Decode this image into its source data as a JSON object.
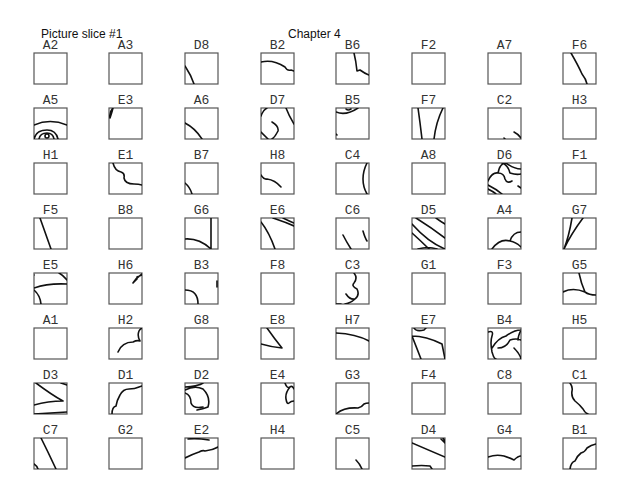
{
  "header": {
    "left_title": "Picture slice #1",
    "center_title": "Chapter 4"
  },
  "grid": {
    "rows": 8,
    "cols": 8,
    "cells": [
      {
        "label": "A2",
        "row": 0,
        "col": 0,
        "path": ""
      },
      {
        "label": "A3",
        "row": 0,
        "col": 1,
        "path": ""
      },
      {
        "label": "D8",
        "row": 0,
        "col": 2,
        "path": "M0 13 Q6 22 9 31"
      },
      {
        "label": "B2",
        "row": 0,
        "col": 3,
        "path": "M0 9 Q12 6 24 14 Q26 18 30 17 L33 18"
      },
      {
        "label": "B6",
        "row": 0,
        "col": 4,
        "path": "M18 0 Q20 8 21 18 L24 17 Q28 20 33 22"
      },
      {
        "label": "F2",
        "row": 0,
        "col": 5,
        "path": ""
      },
      {
        "label": "A7",
        "row": 0,
        "col": 6,
        "path": ""
      },
      {
        "label": "F6",
        "row": 0,
        "col": 7,
        "path": "M8 0 Q15 12 19 21 Q23 26 24 31"
      },
      {
        "label": "A5",
        "row": 1,
        "col": 0,
        "path": "M0 17 Q16 10 33 17 M0 31 Q2 22 13 22 Q22 22 24 31 M5 31 Q6 25 13 25 Q19 25 20 31 M11 28 a2 2 0 1 0 4 0 a2 2 0 1 0 -4 0"
      },
      {
        "label": "E3",
        "row": 1,
        "col": 1,
        "path": "M4 0 Q0 4 1 10 M4 0 Q3 4 1 10"
      },
      {
        "label": "A6",
        "row": 1,
        "col": 2,
        "path": "M0 15 Q10 20 17 31"
      },
      {
        "label": "D7",
        "row": 1,
        "col": 3,
        "path": "M0 8 Q2 2 6 0 M25 0 Q28 8 33 16 M11 14 Q18 18 17 23 Q14 29 11 31 M0 24 Q4 28 7 31"
      },
      {
        "label": "B5",
        "row": 1,
        "col": 4,
        "path": "M0 4 Q10 8 22 0 M15 1 Q12 3 10 1 M0 26 L1 27"
      },
      {
        "label": "F7",
        "row": 1,
        "col": 5,
        "path": "M6 0 Q8 14 10 31 M31 0 Q24 14 22 31"
      },
      {
        "label": "C2",
        "row": 1,
        "col": 6,
        "path": "M26 24 Q30 26 33 30 M16 30 L17 31"
      },
      {
        "label": "H3",
        "row": 1,
        "col": 7,
        "path": ""
      },
      {
        "label": "H1",
        "row": 2,
        "col": 0,
        "path": ""
      },
      {
        "label": "E1",
        "row": 2,
        "col": 1,
        "path": "M4 0 Q6 8 12 9 Q16 10 15 15 Q16 21 25 21 Q30 21 33 22"
      },
      {
        "label": "B7",
        "row": 2,
        "col": 2,
        "path": "M0 20 Q5 24 7 31"
      },
      {
        "label": "H8",
        "row": 2,
        "col": 3,
        "path": "M0 12 Q3 17 6 16 Q14 17 20 24"
      },
      {
        "label": "C4",
        "row": 2,
        "col": 4,
        "path": "M31 0 Q27 8 27 16 Q27 24 31 31"
      },
      {
        "label": "A8",
        "row": 2,
        "col": 5,
        "path": ""
      },
      {
        "label": "D6",
        "row": 2,
        "col": 6,
        "path": "M0 18 Q4 9 10 10 Q16 10 17 16 Q19 21 24 18 M10 10 Q12 0 18 0 M18 0 Q26 6 33 6 M14 0 Q20 2 22 10 Q28 12 33 11 M0 22 Q8 26 14 31 M0 26 Q6 29 8 31 M30 23 L33 25"
      },
      {
        "label": "F1",
        "row": 2,
        "col": 7,
        "path": ""
      },
      {
        "label": "F5",
        "row": 3,
        "col": 0,
        "path": "M6 0 Q11 14 17 31"
      },
      {
        "label": "B8",
        "row": 3,
        "col": 1,
        "path": ""
      },
      {
        "label": "G6",
        "row": 3,
        "col": 2,
        "path": "M26 0 L26 31 M0 21 Q14 20 26 31"
      },
      {
        "label": "E6",
        "row": 3,
        "col": 3,
        "path": "M0 4 Q8 14 14 31 M12 0 Q24 4 33 8 M22 0 Q28 3 33 5"
      },
      {
        "label": "C6",
        "row": 3,
        "col": 4,
        "path": "M7 17 Q10 23 15 31 M27 13 Q29 20 31 23"
      },
      {
        "label": "D5",
        "row": 3,
        "col": 5,
        "path": "M0 6 Q16 24 33 31 M0 15 Q10 24 17 31 M4 0 Q20 10 33 20 M24 0 Q28 3 33 6 M6 31 Q16 28 25 31"
      },
      {
        "label": "A4",
        "row": 3,
        "col": 6,
        "path": "M4 31 Q12 20 22 23 Q25 14 33 14 M22 23 Q28 24 33 29"
      },
      {
        "label": "G7",
        "row": 3,
        "col": 7,
        "path": "M1 31 Q6 18 9 0 M1 31 Q8 16 20 0"
      },
      {
        "label": "E5",
        "row": 4,
        "col": 0,
        "path": "M0 15 Q14 10 33 11 M25 0 Q29 2 33 7 M0 17 Q6 22 7 31 M0 2 L0 2"
      },
      {
        "label": "H6",
        "row": 4,
        "col": 1,
        "path": "M24 10 Q27 5 33 1 M28 4 L33 2 M24 10 L28 6"
      },
      {
        "label": "B3",
        "row": 4,
        "col": 2,
        "path": "M0 17 Q13 17 13 31 M32 8 L32 14"
      },
      {
        "label": "F8",
        "row": 4,
        "col": 3,
        "path": ""
      },
      {
        "label": "C3",
        "row": 4,
        "col": 4,
        "path": "M18 0 Q22 5 18 10 Q15 13 21 16 Q24 22 19 26 Q14 27 10 21 M19 26 Q15 30 9 31 M0 31 L5 31"
      },
      {
        "label": "G1",
        "row": 4,
        "col": 5,
        "path": ""
      },
      {
        "label": "F3",
        "row": 4,
        "col": 6,
        "path": ""
      },
      {
        "label": "G5",
        "row": 4,
        "col": 7,
        "path": "M0 19 Q10 14 22 19 Q26 22 33 22 M16 0 Q18 10 22 19"
      },
      {
        "label": "A1",
        "row": 5,
        "col": 0,
        "path": ""
      },
      {
        "label": "H2",
        "row": 5,
        "col": 1,
        "path": "M9 24 Q13 14 24 14 Q28 12 31 13 M31 13 Q28 8 30 3 Q31 1 33 0"
      },
      {
        "label": "G8",
        "row": 5,
        "col": 2,
        "path": ""
      },
      {
        "label": "E8",
        "row": 5,
        "col": 3,
        "path": "M6 0 Q13 10 21 20 M0 16 Q10 19 21 20"
      },
      {
        "label": "H7",
        "row": 5,
        "col": 4,
        "path": "M0 5 Q20 6 33 13"
      },
      {
        "label": "E7",
        "row": 5,
        "col": 5,
        "path": "M0 8 Q14 8 30 16 L33 31 M0 8 Q4 18 9 31 M2 0 Q4 4 12 2 L14 0"
      },
      {
        "label": "B4",
        "row": 5,
        "col": 6,
        "path": "M0 4 Q6 2 4 8 Q2 14 4 24 Q6 31 8 31 M4 20 Q10 10 18 8 Q26 2 33 2 M10 20 Q18 20 22 12 Q28 10 33 12 M26 20 Q32 26 33 31 M33 2 Q30 8 30 12"
      },
      {
        "label": "H5",
        "row": 5,
        "col": 7,
        "path": ""
      },
      {
        "label": "D3",
        "row": 6,
        "col": 0,
        "path": "M2 0 Q18 12 29 18 M0 22 Q14 18 29 18 M0 31 Q16 30 33 29 M27 0 L33 2"
      },
      {
        "label": "D1",
        "row": 6,
        "col": 1,
        "path": "M3 31 Q3 24 7 23 Q8 17 11 12 Q14 6 20 6 Q26 6 30 4 L33 3"
      },
      {
        "label": "D2",
        "row": 6,
        "col": 2,
        "path": "M0 7 Q10 2 18 6 Q26 14 23 24 Q18 26 12 27 M0 10 Q6 12 6 20 Q8 26 18 24 M0 4 Q14 3 18 0"
      },
      {
        "label": "E4",
        "row": 6,
        "col": 3,
        "path": "M24 0 Q26 6 29 4 Q31 2 33 6 M29 4 Q24 10 25 16 Q26 22 28 20 Q30 18 33 18"
      },
      {
        "label": "G3",
        "row": 6,
        "col": 4,
        "path": "M0 31 Q8 24 22 25 Q26 24 28 21 Q30 20 33 20"
      },
      {
        "label": "F4",
        "row": 6,
        "col": 5,
        "path": ""
      },
      {
        "label": "C8",
        "row": 6,
        "col": 6,
        "path": ""
      },
      {
        "label": "C1",
        "row": 6,
        "col": 7,
        "path": "M7 0 Q10 4 9 8 Q8 14 12 18 Q17 22 20 26 Q22 30 25 31"
      },
      {
        "label": "C7",
        "row": 7,
        "col": 0,
        "path": "M7 0 Q14 14 22 31 M0 26 Q3 28 4 31"
      },
      {
        "label": "G2",
        "row": 7,
        "col": 1,
        "path": ""
      },
      {
        "label": "E2",
        "row": 7,
        "col": 2,
        "path": "M3 1 Q12 0 24 2 M0 20 Q8 16 14 14 Q18 12 20 13 Q28 12 33 9"
      },
      {
        "label": "H4",
        "row": 7,
        "col": 3,
        "path": ""
      },
      {
        "label": "C5",
        "row": 7,
        "col": 4,
        "path": "M20 22 Q24 26 26 31"
      },
      {
        "label": "D4",
        "row": 7,
        "col": 5,
        "path": "M0 5 Q16 12 33 19 M31 0 L33 3 M29 1 L33 5 M0 28 Q10 27 18 28 L20 31"
      },
      {
        "label": "G4",
        "row": 7,
        "col": 6,
        "path": "M0 19 Q8 16 16 18 Q22 20 26 22 Q30 18 33 18"
      },
      {
        "label": "B1",
        "row": 7,
        "col": 7,
        "path": "M7 31 Q8 24 12 23 Q14 18 18 15 Q22 14 24 10 Q28 7 33 6"
      }
    ]
  }
}
